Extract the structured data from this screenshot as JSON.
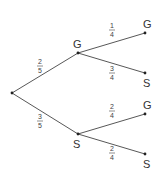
{
  "diagram": {
    "type": "probability-tree",
    "root": {
      "x": 12,
      "y": 93
    },
    "level1": [
      {
        "label": "G",
        "x": 78,
        "y": 53,
        "label_x": 73,
        "label_y": 48,
        "prob_num": "2",
        "prob_den": "5",
        "frac_x": 40,
        "frac_y": 66
      },
      {
        "label": "S",
        "x": 78,
        "y": 134,
        "label_x": 73,
        "label_y": 148,
        "prob_num": "3",
        "prob_den": "5",
        "frac_x": 40,
        "frac_y": 121
      }
    ],
    "level2": [
      {
        "parent": "G",
        "label": "G",
        "x": 145,
        "y": 33,
        "label_x": 143,
        "label_y": 28,
        "prob_num": "1",
        "prob_den": "4",
        "frac_x": 112,
        "frac_y": 30
      },
      {
        "parent": "G",
        "label": "S",
        "x": 145,
        "y": 73,
        "label_x": 143,
        "label_y": 87,
        "prob_num": "3",
        "prob_den": "4",
        "frac_x": 112,
        "frac_y": 73
      },
      {
        "parent": "S",
        "label": "G",
        "x": 145,
        "y": 114,
        "label_x": 143,
        "label_y": 109,
        "prob_num": "2",
        "prob_den": "4",
        "frac_x": 112,
        "frac_y": 111
      },
      {
        "parent": "S",
        "label": "S",
        "x": 145,
        "y": 154,
        "label_x": 143,
        "label_y": 168,
        "prob_num": "2",
        "prob_den": "4",
        "frac_x": 112,
        "frac_y": 153
      }
    ]
  }
}
